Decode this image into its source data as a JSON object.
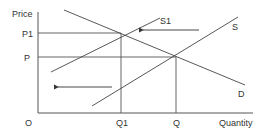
{
  "diagram": {
    "type": "supply-demand",
    "axes": {
      "y_label": "Price",
      "x_label": "Quantity",
      "origin_label": "O"
    },
    "price_levels": [
      {
        "id": "p1",
        "label": "P1"
      },
      {
        "id": "p",
        "label": "P"
      }
    ],
    "quantity_levels": [
      {
        "id": "q1",
        "label": "Q1"
      },
      {
        "id": "q",
        "label": "Q"
      }
    ],
    "curves": [
      {
        "id": "s1",
        "label": "S1",
        "kind": "supply (shifted)"
      },
      {
        "id": "s",
        "label": "S",
        "kind": "supply"
      },
      {
        "id": "d",
        "label": "D",
        "kind": "demand"
      }
    ],
    "arrows": [
      {
        "id": "upper-shift-arrow",
        "direction": "left"
      },
      {
        "id": "lower-shift-arrow",
        "direction": "left"
      }
    ],
    "colors": {
      "line": "#444444",
      "text": "#333333",
      "background": "#ffffff"
    }
  }
}
